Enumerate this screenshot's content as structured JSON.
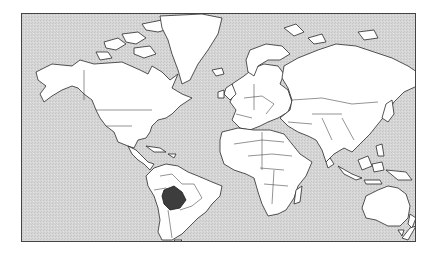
{
  "map": {
    "title": "World map (Mercator projection)",
    "projection": "Mercator",
    "highlighted_country": "Bolivia",
    "colors": {
      "ocean": "#d4d4d4",
      "land": "#ffffff",
      "outline": "#2a2a2a",
      "highlight": "#3d3d3d",
      "frame": "#444444"
    },
    "regions": [
      "North America",
      "Greenland",
      "South America",
      "Europe",
      "Africa",
      "Asia",
      "Australia",
      "New Zealand"
    ]
  }
}
